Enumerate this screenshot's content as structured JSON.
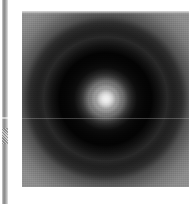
{
  "page": {
    "width": 195,
    "height": 204,
    "background_color": "#ffffff"
  },
  "left_strip": {
    "name": "vertical-edge-strip",
    "x": 2,
    "y": 0,
    "width": 6,
    "height": 204,
    "top_color": "#8d8d8d",
    "highlight_color": "#d6d6d6",
    "seam_y": 117,
    "dither_y": 128,
    "dither_height": 16
  },
  "image_plate": {
    "name": "radial-pattern-image",
    "x": 22,
    "y": 11,
    "width": 167,
    "height": 176,
    "corner_color": "#909090",
    "field_color": "#0a0a0a",
    "core_color": "#f2f2f2",
    "scanline_color": "#bebebe",
    "scanline_y": 107
  },
  "chart_data": {
    "type": "heatmap",
    "title": "",
    "subtitle": "",
    "xlabel": "",
    "ylabel": "",
    "grid": false,
    "legend": "none",
    "colormap": "grayscale",
    "center_px": [
      105,
      99
    ],
    "center_normalized": [
      0.5,
      0.5
    ],
    "value_range": [
      0,
      255
    ],
    "radial_profile": {
      "radius_normalized": [
        0.0,
        0.05,
        0.1,
        0.14,
        0.19,
        0.22,
        0.3,
        0.38,
        0.44,
        0.5,
        0.56,
        0.62,
        0.7,
        0.8,
        0.9,
        1.0
      ],
      "intensity": [
        242,
        232,
        170,
        96,
        52,
        36,
        22,
        16,
        14,
        18,
        30,
        52,
        86,
        120,
        140,
        144
      ],
      "radius_label": "normalized radius from core",
      "intensity_label": "pixel gray level (0-255)"
    },
    "features": [
      {
        "name": "central-core",
        "radius_normalized": 0.0,
        "peak_intensity": 242
      },
      {
        "name": "inner-halo-ring",
        "radius_normalized": 0.14,
        "peak_intensity": 96
      },
      {
        "name": "dark-annulus",
        "radius_normalized": 0.4,
        "peak_intensity": 14
      },
      {
        "name": "outer-bright-ring",
        "radius_normalized": 0.52,
        "peak_intensity": 34
      },
      {
        "name": "corner-background",
        "radius_normalized": 1.0,
        "peak_intensity": 144
      }
    ],
    "artifacts": [
      {
        "name": "horizontal-scanline",
        "orientation": "horizontal",
        "y_px": 118,
        "intensity": 190
      }
    ]
  }
}
